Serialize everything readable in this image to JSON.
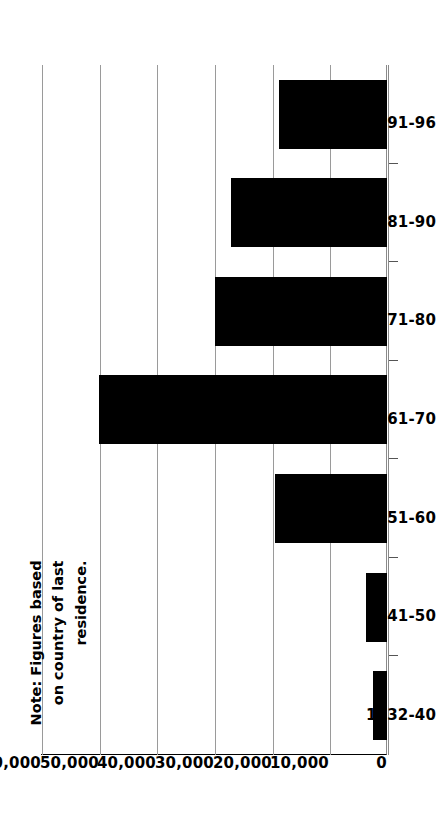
{
  "chart_data": {
    "type": "bar",
    "orientation": "horizontal",
    "title": "",
    "subtitle": "",
    "xlabel": "",
    "ylabel": "",
    "categories": [
      "1932-40",
      "1941-50",
      "1951-60",
      "1961-70",
      "1971-80",
      "1981-90",
      "1991-96"
    ],
    "values": [
      2500,
      3600,
      19500,
      50000,
      29800,
      27000,
      18800
    ],
    "series": [
      {
        "name": "Immigrants",
        "values": [
          2500,
          3600,
          19500,
          50000,
          29800,
          27000,
          18800
        ]
      }
    ],
    "value_axis": {
      "min": 0,
      "max": 60000,
      "tick_values": [
        0,
        10000,
        20000,
        30000,
        40000,
        50000,
        60000
      ],
      "tick_labels": [
        "0",
        "10,000",
        "20,000",
        "30,000",
        "40,000",
        "50,000",
        "60,000"
      ]
    },
    "grid": true,
    "grid_axis": "value",
    "legend": false,
    "legend_position": "none",
    "bar_color": "#000000",
    "background_color": "#ffffff",
    "gridline_color": "#9a9a9a",
    "axis_color": "#8a8a8a"
  },
  "annotations": {
    "note": {
      "line1": "Note: Figures based",
      "line2": "on country of last",
      "line3": "residence.",
      "full_text": "Note: Figures based on country of last residence."
    }
  }
}
